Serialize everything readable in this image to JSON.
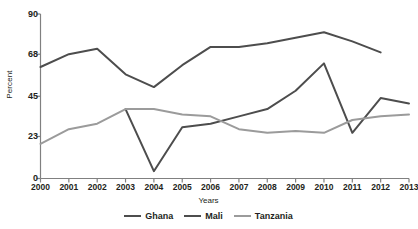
{
  "chart_data": {
    "type": "line",
    "title": "",
    "xlabel": "Years",
    "ylabel": "Percent",
    "categories": [
      "2000",
      "2001",
      "2002",
      "2003",
      "2004",
      "2005",
      "2006",
      "2007",
      "2008",
      "2009",
      "2010",
      "2011",
      "2012",
      "2013"
    ],
    "x": [
      2000,
      2001,
      2002,
      2003,
      2004,
      2005,
      2006,
      2007,
      2008,
      2009,
      2010,
      2011,
      2012,
      2013
    ],
    "xlim": [
      2000,
      2013
    ],
    "ylim": [
      0,
      90
    ],
    "yticks": [
      0,
      23,
      45,
      68,
      90
    ],
    "ytick_labels": [
      "0",
      "23",
      "45",
      "68",
      "90"
    ],
    "grid": false,
    "legend_position": "bottom",
    "series": [
      {
        "name": "Ghana",
        "color": "#4d4d4d",
        "x": [
          2000,
          2001,
          2002,
          2003,
          2004,
          2005,
          2006,
          2007,
          2008,
          2009,
          2010,
          2011,
          2012
        ],
        "values": [
          61,
          68,
          71,
          57,
          50,
          62,
          72,
          72,
          74,
          77,
          80,
          75,
          69
        ]
      },
      {
        "name": "Mali",
        "color": "#4d4d4d",
        "x": [
          2003,
          2004,
          2005,
          2006,
          2007,
          2008,
          2009,
          2010,
          2011,
          2012,
          2013
        ],
        "values": [
          38,
          4,
          28,
          30,
          34,
          38,
          48,
          63,
          25,
          44,
          41
        ]
      },
      {
        "name": "Tanzania",
        "color": "#9b9b9b",
        "x": [
          2000,
          2001,
          2002,
          2003,
          2004,
          2005,
          2006,
          2007,
          2008,
          2009,
          2010,
          2011,
          2012,
          2013
        ],
        "values": [
          19,
          27,
          30,
          38,
          38,
          35,
          34,
          27,
          25,
          26,
          25,
          32,
          34,
          35
        ]
      }
    ]
  },
  "axes": {
    "y_title": "Percent",
    "x_title": "Years"
  },
  "legend": {
    "items": [
      {
        "label": "Ghana",
        "color": "#4d4d4d"
      },
      {
        "label": "Mali",
        "color": "#4d4d4d"
      },
      {
        "label": "Tanzania",
        "color": "#9b9b9b"
      }
    ]
  },
  "colors": {
    "axis": "#808080",
    "text": "#231f20",
    "background": "#ffffff",
    "ghana": "#4d4d4d",
    "mali": "#4d4d4d",
    "tanzania": "#9b9b9b"
  }
}
